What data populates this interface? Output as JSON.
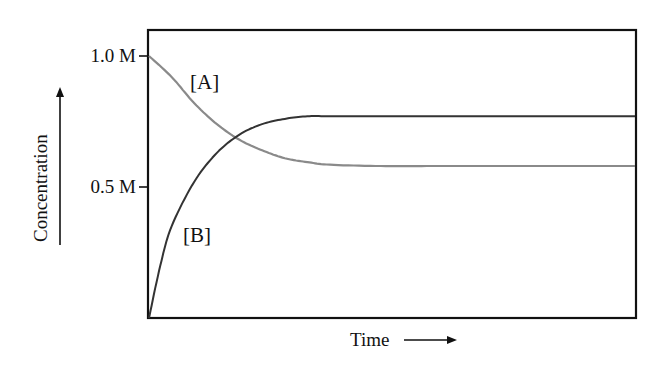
{
  "chart_data": {
    "type": "line",
    "title": "",
    "xlabel": "Time",
    "ylabel": "Concentration",
    "xlabel_arrow": "→",
    "ylabel_arrow": "↑",
    "x_ticks": [],
    "y_ticks": [
      {
        "value": 1.0,
        "label": "1.0 M"
      },
      {
        "value": 0.5,
        "label": "0.5 M"
      }
    ],
    "ylim": [
      0,
      1.1
    ],
    "xlim": [
      0,
      10
    ],
    "grid": false,
    "legend": "inline labels",
    "series": [
      {
        "name": "[A]",
        "color": "#8a8a8a",
        "description": "Reactant concentration decreases from 1.0 M and levels off near 0.58 M",
        "x": [
          0,
          0.5,
          1,
          1.5,
          2,
          2.5,
          3,
          3.5,
          4,
          5,
          6,
          7,
          8,
          9,
          10
        ],
        "values": [
          1.0,
          0.92,
          0.82,
          0.74,
          0.68,
          0.64,
          0.61,
          0.595,
          0.585,
          0.58,
          0.58,
          0.58,
          0.58,
          0.58,
          0.58
        ]
      },
      {
        "name": "[B]",
        "color": "#333333",
        "description": "Product concentration increases from 0 and levels off near 0.77 M",
        "x": [
          0,
          0.25,
          0.5,
          1,
          1.5,
          2,
          2.5,
          3,
          3.5,
          4,
          5,
          6,
          7,
          8,
          9,
          10
        ],
        "values": [
          0.0,
          0.2,
          0.35,
          0.52,
          0.63,
          0.7,
          0.74,
          0.76,
          0.77,
          0.77,
          0.77,
          0.77,
          0.77,
          0.77,
          0.77,
          0.77
        ]
      }
    ],
    "annotations": [
      {
        "text": "[A]",
        "near": "upper-left, above decreasing curve"
      },
      {
        "text": "[B]",
        "near": "lower-left, right of increasing curve"
      }
    ],
    "equilibrium": {
      "A": 0.58,
      "B": 0.77
    }
  },
  "labels": {
    "y_tick_1": "1.0 M",
    "y_tick_05": "0.5 M",
    "series_a": "[A]",
    "series_b": "[B]",
    "xlabel": "Time",
    "ylabel": "Concentration"
  }
}
